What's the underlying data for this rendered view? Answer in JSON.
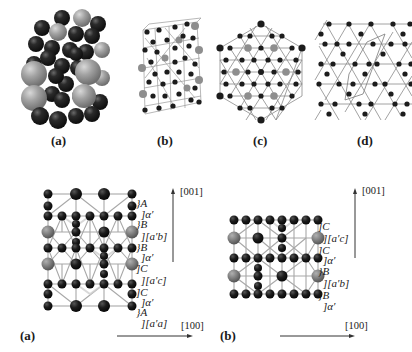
{
  "figure": {
    "top_row": {
      "panels": [
        {
          "id": "a",
          "caption": "(a)",
          "description": "space-filling unit cell model"
        },
        {
          "id": "b",
          "caption": "(b)",
          "description": "ball-and-stick unit cell"
        },
        {
          "id": "c",
          "caption": "(c)",
          "description": "hexagonal projection"
        },
        {
          "id": "d",
          "caption": "(d)",
          "description": "kagome layer with unit cell outline"
        }
      ]
    },
    "bottom_row": {
      "panels": [
        {
          "id": "a",
          "caption": "(a)",
          "axis_vertical": "[001]",
          "axis_horizontal": "[100]",
          "layer_labels": [
            "}A",
            "]α′",
            "}B",
            "][a′b]",
            "}B",
            "]α′",
            "]C",
            "][a′c]",
            "]C",
            "]α′",
            "}A",
            "][a′a]"
          ]
        },
        {
          "id": "b",
          "caption": "(b)",
          "axis_vertical": "[001]",
          "axis_horizontal": "[100]",
          "layer_labels": [
            "]C",
            "][a′c]",
            "]C",
            "]α′",
            "}B",
            "][a′b]",
            "}B",
            "]α′"
          ]
        }
      ]
    },
    "colors": {
      "dark_atom": "#1c1c1c",
      "gray_atom": "#8a8a8a",
      "bond": "#9a9a9a",
      "text": "#1a1a1a"
    }
  }
}
